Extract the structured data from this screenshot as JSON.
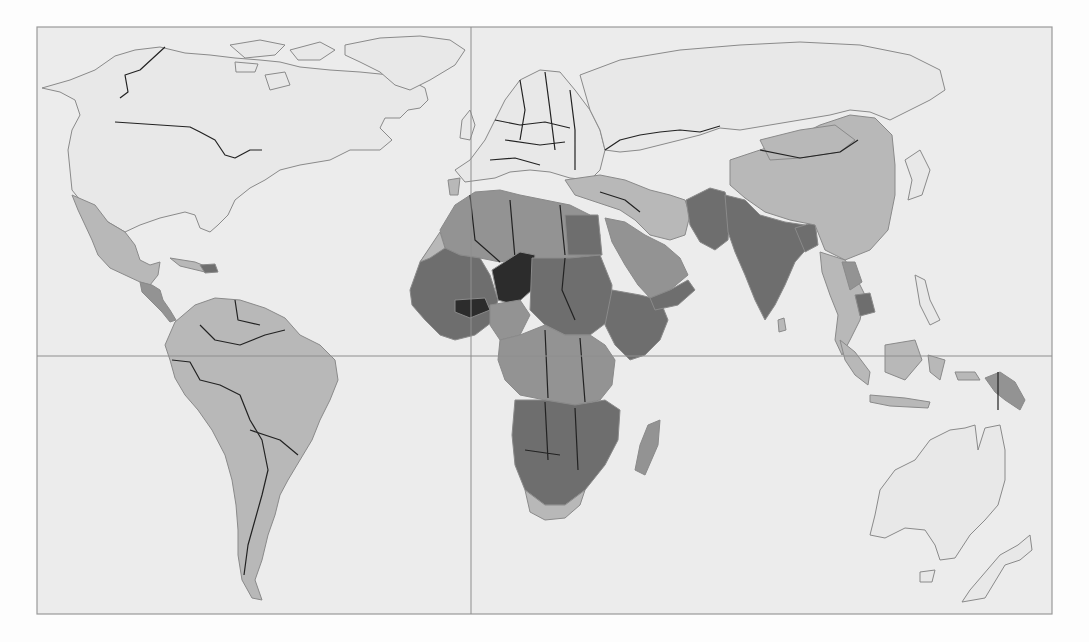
{
  "map": {
    "type": "choropleth-world",
    "projection": "equirectangular-like",
    "frame": {
      "x": 37,
      "y": 27,
      "width": 1015,
      "height": 587
    },
    "gridlines": {
      "prime_meridian_x": 471,
      "equator_y": 356
    },
    "colors": {
      "background": "#ececec",
      "no_data": "#e8e8e8",
      "level_1": "#b8b8b8",
      "level_2": "#939393",
      "level_3": "#6e6e6e",
      "level_4": "#2c2c2c",
      "coast": "#8a8a8a",
      "border": "#222222"
    },
    "regions": [
      {
        "name": "north-america",
        "level": "no_data"
      },
      {
        "name": "greenland",
        "level": "no_data"
      },
      {
        "name": "mexico",
        "level": "level_1"
      },
      {
        "name": "central-america",
        "level": "level_2"
      },
      {
        "name": "south-america",
        "level": "level_1"
      },
      {
        "name": "europe",
        "level": "no_data"
      },
      {
        "name": "russia",
        "level": "no_data"
      },
      {
        "name": "north-africa",
        "level": "level_2"
      },
      {
        "name": "west-africa",
        "level": "level_3"
      },
      {
        "name": "niger",
        "level": "level_4"
      },
      {
        "name": "burkina-faso",
        "level": "level_4"
      },
      {
        "name": "sudan",
        "level": "level_3"
      },
      {
        "name": "ethiopia",
        "level": "level_3"
      },
      {
        "name": "central-africa",
        "level": "level_2"
      },
      {
        "name": "southern-africa",
        "level": "level_3"
      },
      {
        "name": "south-africa",
        "level": "level_1"
      },
      {
        "name": "madagascar",
        "level": "level_2"
      },
      {
        "name": "arabia",
        "level": "level_2"
      },
      {
        "name": "yemen",
        "level": "level_3"
      },
      {
        "name": "turkey-iran",
        "level": "level_1"
      },
      {
        "name": "afghanistan-pakistan",
        "level": "level_3"
      },
      {
        "name": "india",
        "level": "level_3"
      },
      {
        "name": "china",
        "level": "level_1"
      },
      {
        "name": "mongolia",
        "level": "level_1"
      },
      {
        "name": "southeast-asia",
        "level": "level_1"
      },
      {
        "name": "cambodia",
        "level": "level_3"
      },
      {
        "name": "indonesia",
        "level": "level_1"
      },
      {
        "name": "papua-new-guinea",
        "level": "level_2"
      },
      {
        "name": "australia",
        "level": "no_data"
      },
      {
        "name": "new-zealand",
        "level": "no_data"
      }
    ]
  }
}
